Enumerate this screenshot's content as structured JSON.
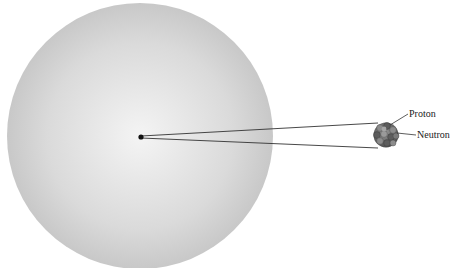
{
  "diagram": {
    "atom": {
      "name": "atom",
      "fill_center": "#f4f4f4",
      "fill_edge": "#c8c8c8"
    },
    "nucleus_dot": {
      "name": "nucleus-dot",
      "color": "#111111"
    },
    "nucleus": {
      "name": "magnified-nucleus",
      "proton_color": "#8a8a8a",
      "neutron_color": "#5a5a5a"
    },
    "labels": {
      "proton": "Proton",
      "neutron": "Neutron"
    }
  }
}
